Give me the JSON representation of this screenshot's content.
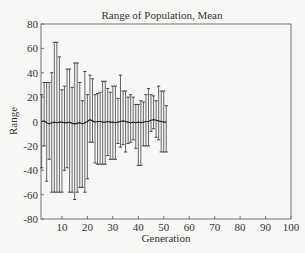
{
  "chart_data": {
    "type": "line",
    "title": "Range of Population, Mean",
    "xlabel": "Generation",
    "ylabel": "Range",
    "xlim": [
      2,
      100
    ],
    "ylim": [
      -80,
      80
    ],
    "xticks": [
      10,
      20,
      30,
      40,
      50,
      60,
      70,
      80,
      90,
      100
    ],
    "yticks": [
      80,
      60,
      40,
      20,
      0,
      -20,
      -40,
      -60,
      -80
    ],
    "grid": false,
    "legend": null,
    "series": [
      {
        "name": "Mean",
        "style": "line with error bars",
        "x": [
          2,
          3,
          4,
          5,
          6,
          7,
          8,
          9,
          10,
          11,
          12,
          13,
          14,
          15,
          16,
          17,
          18,
          19,
          20,
          21,
          22,
          23,
          24,
          25,
          26,
          27,
          28,
          29,
          30,
          31,
          32,
          33,
          34,
          35,
          36,
          37,
          38,
          39,
          40,
          41,
          42,
          43,
          44,
          45,
          46,
          47,
          48,
          49,
          50,
          51
        ],
        "mean": [
          0,
          0.5,
          -1,
          -2,
          -1,
          -0.5,
          -1,
          -0.5,
          -0.5,
          -1,
          -1,
          -0.5,
          -1.5,
          -2,
          -1.5,
          -1,
          -2,
          -1,
          0,
          1.5,
          0.5,
          -0.5,
          0,
          0,
          -0.5,
          -0.5,
          0,
          -0.5,
          -0.5,
          -1,
          -0.5,
          0,
          0.5,
          0,
          -0.5,
          -1,
          -0.5,
          -1,
          -0.5,
          -1,
          -0.5,
          0,
          0,
          1,
          1.5,
          1,
          0.5,
          0,
          -0.5,
          -0.5
        ],
        "upper": [
          22,
          32,
          32,
          32,
          40,
          65,
          65,
          53,
          26,
          29,
          43,
          43,
          28,
          48,
          48,
          32,
          17,
          41,
          22,
          38,
          35,
          22,
          23,
          24,
          33,
          33,
          27,
          24,
          29,
          29,
          19,
          38,
          25,
          25,
          20,
          22,
          20,
          14,
          14,
          17,
          16,
          22,
          27,
          22,
          21,
          17,
          29,
          25,
          25,
          13
        ],
        "lower": [
          -38,
          -20,
          -49,
          -31,
          -58,
          -58,
          -58,
          -58,
          -58,
          -40,
          -38,
          -58,
          -58,
          -64,
          -58,
          -54,
          -54,
          -58,
          -47,
          -17,
          -17,
          -34,
          -35,
          -35,
          -35,
          -35,
          -28,
          -31,
          -31,
          -31,
          -18,
          -21,
          -19,
          -25,
          -18,
          -17,
          -15,
          -22,
          -36,
          -36,
          -20,
          -20,
          -20,
          -8,
          -6,
          -13,
          -15,
          -25,
          -25,
          -25
        ]
      }
    ]
  }
}
